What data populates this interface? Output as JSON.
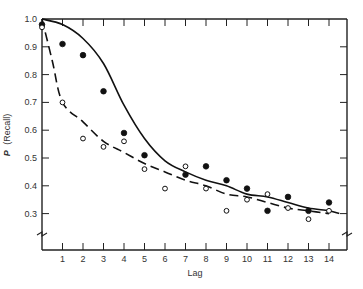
{
  "chart_data": {
    "type": "scatter",
    "title": "",
    "xlabel": "Lag",
    "ylabel_italic": "P",
    "ylabel_rest": "(Recall)",
    "ylabel": "P (Recall)",
    "xlim": [
      0,
      14.8
    ],
    "ylim": [
      0.22,
      1.0
    ],
    "x_ticks": [
      1,
      2,
      3,
      4,
      5,
      6,
      7,
      8,
      9,
      10,
      11,
      12,
      13,
      14
    ],
    "y_ticks": [
      1.0,
      0.9,
      0.8,
      0.7,
      0.6,
      0.5,
      0.4,
      0.3
    ],
    "y_tick_labels": [
      "1.0",
      "0.9",
      "0.8",
      "0.7",
      "0.6",
      "0.5",
      "0.4",
      "0.3"
    ],
    "axis_break": true,
    "grid": false,
    "legend": null,
    "series": [
      {
        "name": "filled-circles",
        "marker": "filled-circle",
        "x": [
          0,
          1,
          2,
          3,
          4,
          5,
          7,
          8,
          9,
          10,
          11,
          12,
          13,
          14
        ],
        "values": [
          0.98,
          0.91,
          0.87,
          0.74,
          0.59,
          0.51,
          0.44,
          0.47,
          0.42,
          0.39,
          0.31,
          0.36,
          0.31,
          0.34
        ]
      },
      {
        "name": "open-circles",
        "marker": "open-circle",
        "x": [
          0,
          1,
          2,
          3,
          4,
          5,
          6,
          7,
          8,
          9,
          10,
          11,
          12,
          13,
          14
        ],
        "values": [
          0.97,
          0.7,
          0.57,
          0.54,
          0.56,
          0.46,
          0.39,
          0.47,
          0.39,
          0.31,
          0.35,
          0.37,
          0.32,
          0.28,
          0.31
        ]
      },
      {
        "name": "fit-solid",
        "line": "solid",
        "x": [
          0,
          1,
          2,
          3,
          4,
          5,
          6,
          7,
          8,
          9,
          10,
          11,
          12,
          13,
          14,
          14.5
        ],
        "values": [
          1.0,
          0.98,
          0.93,
          0.84,
          0.69,
          0.57,
          0.49,
          0.45,
          0.42,
          0.4,
          0.37,
          0.36,
          0.34,
          0.32,
          0.31,
          0.3
        ]
      },
      {
        "name": "fit-dashed",
        "line": "dashed",
        "x": [
          0,
          0.5,
          1,
          2,
          3,
          4,
          5,
          6,
          7,
          8,
          9,
          10,
          11,
          12,
          13,
          14
        ],
        "values": [
          1.0,
          0.85,
          0.7,
          0.63,
          0.56,
          0.52,
          0.48,
          0.45,
          0.42,
          0.4,
          0.37,
          0.36,
          0.34,
          0.32,
          0.31,
          0.3
        ]
      }
    ]
  }
}
